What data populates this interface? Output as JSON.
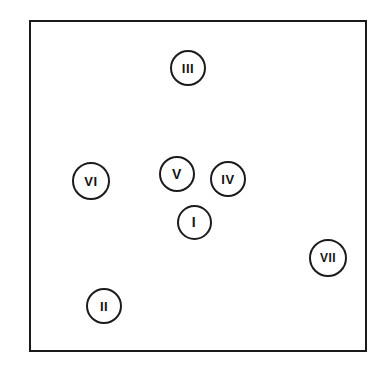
{
  "figure": {
    "name": "numbered-circle-scatter-diagram",
    "background_color": "#ffffff",
    "frame": {
      "border_color": "#1a1a1a",
      "border_width_px": 2,
      "fill_color": "#ffffff",
      "left_px": 29,
      "top_px": 20,
      "width_px": 338,
      "height_px": 332
    },
    "marker_style": {
      "shape": "circle",
      "stroke_color": "#1c1c1c",
      "stroke_width_px": 2,
      "fill_color": "#ffffff",
      "text_color": "#141414"
    }
  },
  "chart_data": {
    "type": "scatter",
    "title": "",
    "subtitle": "",
    "xlabel": "",
    "ylabel": "",
    "xlim": [
      29,
      367
    ],
    "ylim": [
      20,
      352
    ],
    "grid": false,
    "legend": "none",
    "axis_ticks": [],
    "annotations": [],
    "point_labels": [
      "I",
      "II",
      "III",
      "IV",
      "V",
      "VI",
      "VII"
    ],
    "x": [
      194,
      104,
      188,
      228,
      177,
      91,
      328
    ],
    "y": [
      222,
      306,
      68,
      179,
      174,
      181,
      258
    ],
    "points": [
      {
        "label": "III",
        "x": 188,
        "y": 68,
        "diameter_px": 36,
        "font_size_px": 13
      },
      {
        "label": "VI",
        "x": 91,
        "y": 181,
        "diameter_px": 38,
        "font_size_px": 13
      },
      {
        "label": "V",
        "x": 177,
        "y": 174,
        "diameter_px": 36,
        "font_size_px": 14
      },
      {
        "label": "IV",
        "x": 228,
        "y": 179,
        "diameter_px": 36,
        "font_size_px": 13
      },
      {
        "label": "I",
        "x": 194,
        "y": 222,
        "diameter_px": 35,
        "font_size_px": 14
      },
      {
        "label": "VII",
        "x": 328,
        "y": 258,
        "diameter_px": 38,
        "font_size_px": 12
      },
      {
        "label": "II",
        "x": 104,
        "y": 306,
        "diameter_px": 36,
        "font_size_px": 13
      }
    ]
  }
}
